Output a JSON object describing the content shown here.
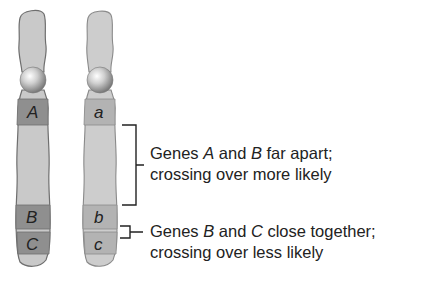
{
  "figure": {
    "chromosomes": [
      {
        "id": "homolog-1",
        "color": "#c9c9c9",
        "band_color": "#8f8f8f",
        "genes": [
          {
            "label": "A",
            "position": "upper"
          },
          {
            "label": "B",
            "position": "lower"
          },
          {
            "label": "C",
            "position": "bottom"
          }
        ]
      },
      {
        "id": "homolog-2",
        "color": "#cdcdcd",
        "band_color": "#b3b3b3",
        "genes": [
          {
            "label": "a",
            "position": "upper"
          },
          {
            "label": "b",
            "position": "lower"
          },
          {
            "label": "c",
            "position": "bottom"
          }
        ]
      }
    ],
    "annotations": [
      {
        "bracket": "large",
        "line1_prefix": "Genes ",
        "gene1": "A",
        "line1_mid": " and ",
        "gene2": "B",
        "line1_suffix": " far apart;",
        "line2": "crossing over more likely"
      },
      {
        "bracket": "small",
        "line1_prefix": "Genes ",
        "gene1": "B",
        "line1_mid": " and ",
        "gene2": "C",
        "line1_suffix": " close together;",
        "line2": "crossing over less likely"
      }
    ]
  }
}
